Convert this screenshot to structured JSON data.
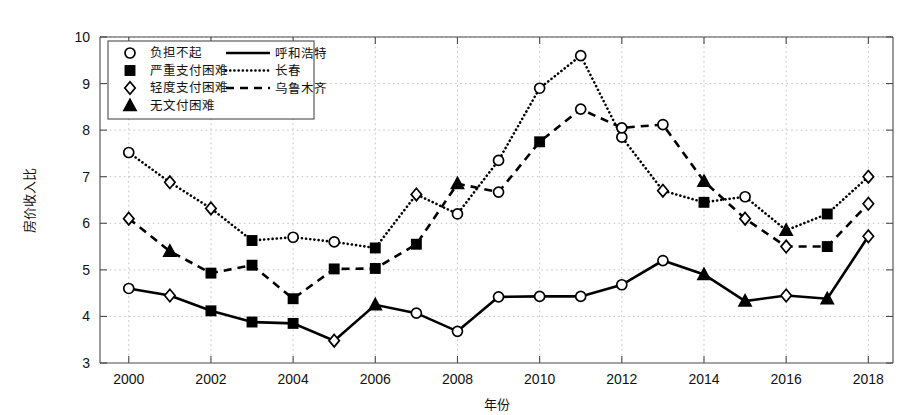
{
  "chart_data": {
    "type": "line",
    "title": "",
    "xlabel": "年份",
    "ylabel": "房价收入比",
    "xlim": [
      1999.3,
      2018.6
    ],
    "ylim": [
      3,
      10
    ],
    "grid": true,
    "legend_position": "top-left",
    "x": [
      2000,
      2001,
      2002,
      2003,
      2004,
      2005,
      2006,
      2007,
      2008,
      2009,
      2010,
      2011,
      2012,
      2013,
      2014,
      2015,
      2016,
      2017,
      2018
    ],
    "xticks": [
      "2000",
      "2002",
      "2004",
      "2006",
      "2008",
      "2010",
      "2012",
      "2014",
      "2016",
      "2018"
    ],
    "xtick_values": [
      2000,
      2002,
      2004,
      2006,
      2008,
      2010,
      2012,
      2014,
      2016,
      2018
    ],
    "yticks": [
      "3",
      "4",
      "5",
      "6",
      "7",
      "8",
      "9",
      "10"
    ],
    "ytick_values": [
      3,
      4,
      5,
      6,
      7,
      8,
      9,
      10
    ],
    "series": [
      {
        "name": "呼和浩特",
        "line_style": "solid",
        "values": [
          4.6,
          4.45,
          4.12,
          3.88,
          3.85,
          3.48,
          4.25,
          4.07,
          3.68,
          4.42,
          4.43,
          4.43,
          4.68,
          5.2,
          4.9,
          4.33,
          4.45,
          4.38,
          5.72
        ],
        "markers": [
          "circle",
          "diamond",
          "square",
          "square",
          "square",
          "diamond",
          "triangle",
          "circle",
          "circle",
          "circle",
          "circle",
          "circle",
          "circle",
          "circle",
          "triangle",
          "triangle",
          "diamond",
          "triangle",
          "diamond"
        ]
      },
      {
        "name": "长春",
        "line_style": "dotted",
        "values": [
          7.52,
          6.88,
          6.32,
          5.63,
          5.7,
          5.6,
          5.47,
          6.62,
          6.2,
          7.35,
          8.9,
          9.6,
          7.85,
          6.7,
          6.45,
          6.57,
          5.85,
          6.2,
          7.0
        ],
        "markers": [
          "circle",
          "diamond",
          "diamond",
          "square",
          "circle",
          "circle",
          "square",
          "diamond",
          "circle",
          "circle",
          "circle",
          "circle",
          "circle",
          "diamond",
          "square",
          "circle",
          "triangle",
          "square",
          "diamond"
        ]
      },
      {
        "name": "乌鲁木齐",
        "line_style": "dashed",
        "values": [
          6.1,
          5.4,
          4.93,
          5.1,
          4.38,
          5.02,
          5.03,
          5.55,
          6.85,
          6.67,
          7.75,
          8.45,
          8.05,
          8.12,
          6.9,
          6.1,
          5.5,
          5.5,
          6.42
        ],
        "markers": [
          "diamond",
          "triangle",
          "square",
          "square",
          "square",
          "square",
          "square",
          "square",
          "triangle",
          "circle",
          "square",
          "circle",
          "circle",
          "circle",
          "triangle",
          "diamond",
          "diamond",
          "square",
          "diamond"
        ]
      }
    ],
    "marker_legend": [
      {
        "marker": "circle",
        "label": "负担不起"
      },
      {
        "marker": "square",
        "label": "严重支付困难"
      },
      {
        "marker": "diamond",
        "label": "轻度支付困难"
      },
      {
        "marker": "triangle",
        "label": "无文付困难"
      }
    ],
    "line_legend": [
      {
        "line_style": "solid",
        "label": "呼和浩特"
      },
      {
        "line_style": "dotted",
        "label": "长春"
      },
      {
        "line_style": "dashed",
        "label": "乌鲁木齐"
      }
    ],
    "colors": {
      "series": "#000000",
      "grid": "#bdbdbd",
      "axis": "#4a4a4a",
      "background": "#ffffff"
    }
  }
}
